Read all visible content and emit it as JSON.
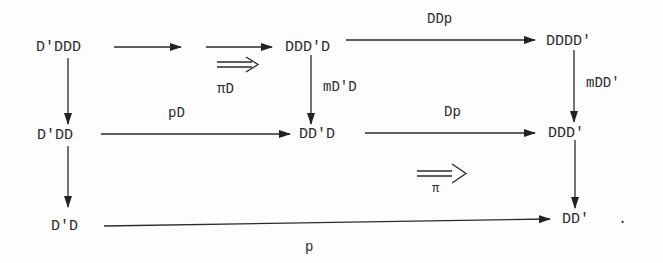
{
  "diagram": {
    "type": "commutative-diagram",
    "nodes": {
      "n_dpddd": "D'DDD",
      "n_dddpd": "DDD'D",
      "n_ddddp": "DDDD'",
      "n_dpdd": "D'DD",
      "n_ddpd": "DD'D",
      "n_dddp": "DDD'",
      "n_dpd": "D'D",
      "n_ddp": "DD'",
      "period": "."
    },
    "edges": [
      {
        "from": "D'DDD",
        "to": "DDD'D",
        "label": ""
      },
      {
        "from": "DDD'D",
        "to": "DDDD'",
        "label": "DDp"
      },
      {
        "from": "D'DDD",
        "to": "D'DD",
        "label": ""
      },
      {
        "from": "DDD'D",
        "to": "DD'D",
        "label": "mD'D"
      },
      {
        "from": "DDDD'",
        "to": "DDD'",
        "label": "mDD'"
      },
      {
        "from": "D'DD",
        "to": "DD'D",
        "label": "pD"
      },
      {
        "from": "DD'D",
        "to": "DDD'",
        "label": "Dp"
      },
      {
        "from": "D'DD",
        "to": "D'D",
        "label": ""
      },
      {
        "from": "DDD'",
        "to": "DD'",
        "label": ""
      },
      {
        "from": "D'D",
        "to": "DD'",
        "label": "p"
      }
    ],
    "labels": {
      "ddp": "DDp",
      "md_d": "mD'D",
      "mdd": "mDD'",
      "pd": "pD",
      "dp": "Dp",
      "p": "p",
      "pi_d": "πD",
      "pi": "π"
    },
    "two_cells": [
      {
        "label": "πD",
        "symbol": "⟹"
      },
      {
        "label": "π",
        "symbol": "⟹"
      }
    ]
  }
}
